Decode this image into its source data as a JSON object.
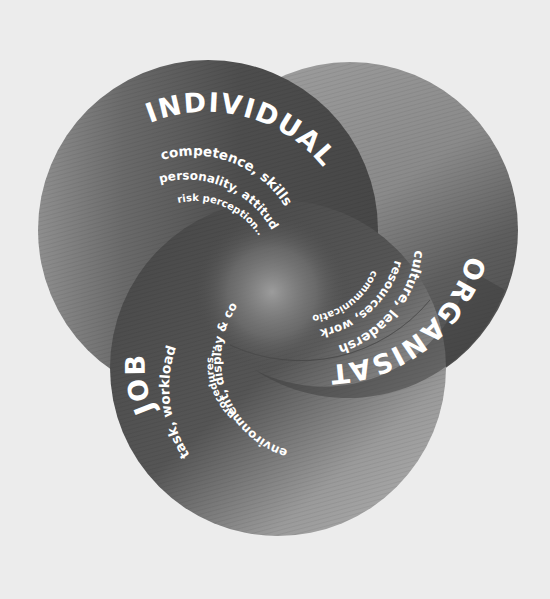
{
  "diagram": {
    "background": "#ececec",
    "circles": [
      {
        "id": "individual",
        "title": "INDIVIDUAL",
        "lines": [
          "competence, skills",
          "personality, attitudes",
          "risk perception..."
        ],
        "fill_dark": "#4a4a4a",
        "fill_light": "#8a8a8a"
      },
      {
        "id": "organisation",
        "title": "ORGANISATION",
        "lines": [
          "culture, leadership",
          "resources, work patterns",
          "communications..."
        ],
        "fill_dark": "#454545",
        "fill_light": "#a0a0a0"
      },
      {
        "id": "job",
        "title": "JOB",
        "lines": [
          "task, workload",
          "environment, display & controls",
          "procedures..."
        ],
        "fill_dark": "#444444",
        "fill_light": "#a8a8a8"
      }
    ],
    "center_highlight": "#9a9a9a"
  }
}
